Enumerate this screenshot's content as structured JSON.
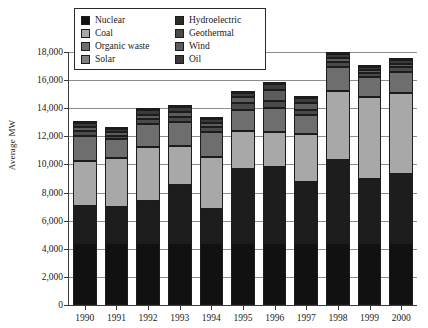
{
  "chart_data": {
    "type": "bar",
    "subtype": "stacked-bar",
    "title": "",
    "xlabel": "",
    "ylabel": "Average MW",
    "ylim": [
      0,
      18000
    ],
    "ytick_step": 2000,
    "grid": true,
    "legend_position": "top-left-inside",
    "categories": [
      "1990",
      "1991",
      "1992",
      "1993",
      "1994",
      "1995",
      "1996",
      "1997",
      "1998",
      "1999",
      "2000"
    ],
    "ytick_labels": [
      "0",
      "2,000",
      "4,000",
      "6,000",
      "8,000",
      "10,000",
      "12,000",
      "14,000",
      "16,000",
      "18,000"
    ],
    "ytick_values": [
      0,
      2000,
      4000,
      6000,
      8000,
      10000,
      12000,
      14000,
      16000,
      18000
    ],
    "stack_order_bottom_to_top": [
      "Nuclear",
      "Hydroelectric",
      "Coal",
      "Organic waste",
      "Geothermal",
      "Wind",
      "Oil",
      "Solar"
    ],
    "series": [
      {
        "name": "Nuclear",
        "color": "#111111",
        "values": [
          4400,
          4400,
          4400,
          4400,
          4400,
          4400,
          4400,
          4400,
          4400,
          4400,
          4400
        ]
      },
      {
        "name": "Hydroelectric",
        "color": "#1d1d1d",
        "values": [
          2650,
          2550,
          3000,
          4150,
          2400,
          5300,
          5400,
          4350,
          5900,
          4600,
          4900
        ]
      },
      {
        "name": "Coal",
        "color": "#a8a8a8",
        "values": [
          3200,
          3500,
          3850,
          2750,
          3700,
          2700,
          2500,
          3400,
          4950,
          5800,
          5750
        ]
      },
      {
        "name": "Organic waste",
        "color": "#6e6e6e",
        "values": [
          1750,
          1350,
          1600,
          1700,
          1800,
          1500,
          1700,
          1350,
          1650,
          1400,
          1500
        ]
      },
      {
        "name": "Geothermal",
        "color": "#4a4a4a",
        "values": [
          350,
          250,
          400,
          400,
          350,
          450,
          550,
          400,
          400,
          300,
          350
        ]
      },
      {
        "name": "Wind",
        "color": "#5c5c5c",
        "values": [
          300,
          250,
          300,
          350,
          300,
          450,
          750,
          450,
          250,
          200,
          250
        ]
      },
      {
        "name": "Oil",
        "color": "#3a3a3a",
        "values": [
          300,
          250,
          300,
          350,
          300,
          300,
          450,
          350,
          300,
          200,
          250
        ]
      },
      {
        "name": "Solar",
        "color": "#808080",
        "values": [
          120,
          100,
          120,
          120,
          120,
          120,
          120,
          120,
          120,
          100,
          120
        ]
      }
    ],
    "totals": [
      13070,
      12650,
      13970,
      14220,
      13370,
      15220,
      15870,
      14820,
      17970,
      17000,
      17520
    ]
  },
  "legend": {
    "items": [
      {
        "label": "Nuclear",
        "swatch_name": "legend-swatch-nuclear",
        "color": "#111111"
      },
      {
        "label": "Hydroelectric",
        "swatch_name": "legend-swatch-hydroelectric",
        "color": "#2b2b2b"
      },
      {
        "label": "Coal",
        "swatch_name": "legend-swatch-coal",
        "color": "#a8a8a8"
      },
      {
        "label": "Geothermal",
        "swatch_name": "legend-swatch-geothermal",
        "color": "#4a4a4a"
      },
      {
        "label": "Organic waste",
        "swatch_name": "legend-swatch-organic-waste",
        "color": "#6e6e6e"
      },
      {
        "label": "Wind",
        "swatch_name": "legend-swatch-wind",
        "color": "#5c5c5c"
      },
      {
        "label": "Solar",
        "swatch_name": "legend-swatch-solar",
        "color": "#808080"
      },
      {
        "label": "Oil",
        "swatch_name": "legend-swatch-oil",
        "color": "#3a3a3a"
      }
    ]
  }
}
